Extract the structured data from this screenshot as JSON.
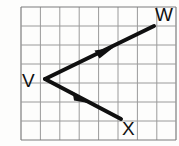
{
  "figure": {
    "type": "geometry-angle-diagram",
    "background_color": "#fdfdfc",
    "grid": {
      "visible": true,
      "columns": 8,
      "rows": 7,
      "cell_size": 19.2,
      "origin_x": 21,
      "origin_y": 7,
      "line_color": "#9a9a9a",
      "border_color": "#7d7d7d",
      "line_width": 1
    },
    "stroke_color": "#101010",
    "stroke_width": 4,
    "vertex": {
      "name": "V",
      "label": "V",
      "x": 45,
      "y": 79,
      "label_x": 22,
      "label_y": 86
    },
    "rays": [
      {
        "name": "ray-VW",
        "from": "V",
        "to": "W",
        "start_x": 45,
        "start_y": 79,
        "end_x": 154,
        "end_y": 26,
        "arrowhead": true,
        "arrow_x": 104,
        "arrow_y": 53,
        "endpoint_label": "W",
        "label_x": 155,
        "label_y": 21
      },
      {
        "name": "ray-VX",
        "from": "V",
        "to": "X",
        "start_x": 45,
        "start_y": 79,
        "end_x": 121,
        "end_y": 119,
        "arrowhead": true,
        "arrow_x": 82,
        "arrow_y": 98,
        "endpoint_label": "X",
        "label_x": 122,
        "label_y": 134
      }
    ],
    "labels": {
      "v": "V",
      "w": "W",
      "x": "X"
    }
  }
}
